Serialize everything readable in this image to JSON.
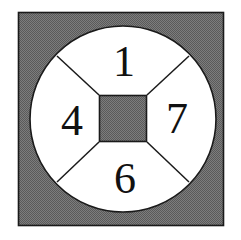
{
  "figure": {
    "canvas": {
      "width": 241,
      "height": 240,
      "background": "#ffffff"
    },
    "outer_square": {
      "name": "gray-background-square",
      "x": 18,
      "y": 12,
      "width": 206,
      "height": 214,
      "fill": "#6f6f6f",
      "stroke": "#1a1a1a",
      "pattern": "halftone-dither"
    },
    "circle": {
      "name": "white-circle",
      "cx": 123,
      "cy": 119,
      "r": 93,
      "fill": "#ffffff",
      "stroke": "#1a1a1a"
    },
    "center_square": {
      "name": "gray-center-square",
      "x": 99,
      "y": 95,
      "width": 48,
      "height": 47,
      "fill": "#6f6f6f",
      "stroke": "#1a1a1a",
      "pattern": "halftone-dither"
    },
    "divider_lines": [
      {
        "name": "divider-upper-left",
        "x1": 99,
        "y1": 95,
        "x2": 57,
        "y2": 56
      },
      {
        "name": "divider-upper-right",
        "x1": 147,
        "y1": 95,
        "x2": 189,
        "y2": 56
      },
      {
        "name": "divider-lower-left",
        "x1": 99,
        "y1": 142,
        "x2": 57,
        "y2": 182
      },
      {
        "name": "divider-lower-right",
        "x1": 147,
        "y1": 142,
        "x2": 189,
        "y2": 182
      }
    ],
    "sectors": [
      {
        "name": "sector-top",
        "label": "1",
        "cx": 124,
        "cy": 61
      },
      {
        "name": "sector-left",
        "label": "4",
        "cx": 72,
        "cy": 120
      },
      {
        "name": "sector-right",
        "label": "7",
        "cx": 177,
        "cy": 118
      },
      {
        "name": "sector-bottom",
        "label": "6",
        "cx": 125,
        "cy": 178
      }
    ]
  }
}
